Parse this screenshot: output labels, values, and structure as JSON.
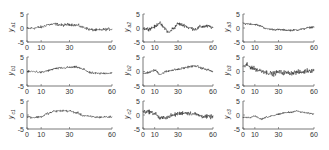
{
  "figure": {
    "layout": {
      "rows": 3,
      "cols": 3
    },
    "axes_color": "#555555",
    "line_color": "#222222"
  },
  "chart_data": [
    {
      "type": "line",
      "id": "a1",
      "ylabel": "y",
      "ylabel_sub": "a1",
      "xlim": [
        0,
        60
      ],
      "ylim": [
        -5,
        5
      ],
      "xticks": [
        0,
        10,
        30,
        60
      ],
      "yticks": [
        5,
        0,
        -5
      ],
      "trend_x": [
        0,
        5,
        10,
        15,
        20,
        25,
        30,
        35,
        40,
        45,
        50,
        55,
        60
      ],
      "trend_y": [
        -0.2,
        0.0,
        0.3,
        1.2,
        1.4,
        1.0,
        1.3,
        1.0,
        0.2,
        -0.6,
        -0.8,
        -0.5,
        -0.4
      ],
      "noise": 0.45
    },
    {
      "type": "line",
      "id": "a2",
      "ylabel": "y",
      "ylabel_sub": "a2",
      "xlim": [
        0,
        60
      ],
      "ylim": [
        -5,
        5
      ],
      "xticks": [
        0,
        10,
        30,
        60
      ],
      "yticks": [
        5,
        0,
        -5
      ],
      "trend_x": [
        0,
        5,
        10,
        14,
        18,
        22,
        26,
        30,
        35,
        40,
        45,
        50,
        55,
        60
      ],
      "trend_y": [
        -0.2,
        -0.3,
        0.4,
        1.8,
        0.2,
        -1.6,
        -0.2,
        1.5,
        1.0,
        0.0,
        -0.4,
        0.5,
        0.6,
        0.2
      ],
      "noise": 0.55
    },
    {
      "type": "line",
      "id": "a3",
      "ylabel": "y",
      "ylabel_sub": "a3",
      "xlim": [
        0,
        60
      ],
      "ylim": [
        -5,
        5
      ],
      "xticks": [
        0,
        10,
        30,
        60
      ],
      "yticks": [
        5,
        0,
        -5
      ],
      "trend_x": [
        0,
        5,
        10,
        15,
        20,
        25,
        30,
        35,
        40,
        45,
        50,
        55,
        60
      ],
      "trend_y": [
        1.6,
        1.5,
        1.3,
        0.7,
        -0.3,
        -0.5,
        -0.6,
        -0.7,
        -0.8,
        -0.7,
        -0.4,
        0.1,
        0.4
      ],
      "noise": 0.3
    },
    {
      "type": "line",
      "id": "b1",
      "ylabel": "y",
      "ylabel_sub": "b1",
      "xlim": [
        0,
        60
      ],
      "ylim": [
        -5,
        5
      ],
      "xticks": [
        0,
        10,
        30,
        60
      ],
      "yticks": [
        5,
        0,
        -5
      ],
      "trend_x": [
        0,
        5,
        10,
        15,
        20,
        25,
        30,
        35,
        40,
        45,
        50,
        55,
        60
      ],
      "trend_y": [
        -0.1,
        0.0,
        -0.3,
        0.3,
        1.0,
        1.2,
        1.4,
        1.5,
        0.7,
        -0.5,
        -0.7,
        -0.6,
        -0.5
      ],
      "noise": 0.35
    },
    {
      "type": "line",
      "id": "b2",
      "ylabel": "y",
      "ylabel_sub": "b2",
      "xlim": [
        0,
        60
      ],
      "ylim": [
        -5,
        5
      ],
      "xticks": [
        0,
        10,
        30,
        60
      ],
      "yticks": [
        5,
        0,
        -5
      ],
      "trend_x": [
        0,
        5,
        10,
        15,
        20,
        25,
        30,
        35,
        40,
        45,
        50,
        55,
        60
      ],
      "trend_y": [
        -0.8,
        -0.3,
        0.4,
        -0.9,
        0.0,
        0.5,
        0.7,
        1.2,
        1.7,
        1.9,
        1.2,
        0.6,
        0.0
      ],
      "noise": 0.35
    },
    {
      "type": "line",
      "id": "b3",
      "ylabel": "y",
      "ylabel_sub": "b3",
      "xlim": [
        0,
        60
      ],
      "ylim": [
        -5,
        5
      ],
      "xticks": [
        0,
        10,
        30,
        60
      ],
      "yticks": [
        5,
        0,
        -5
      ],
      "trend_x": [
        0,
        3,
        6,
        10,
        15,
        20,
        25,
        30,
        35,
        40,
        45,
        50,
        55,
        60
      ],
      "trend_y": [
        1.5,
        2.2,
        1.6,
        0.9,
        0.3,
        -0.3,
        -0.8,
        -0.2,
        -0.4,
        -0.5,
        -0.3,
        -0.2,
        0.3,
        0.4
      ],
      "noise": 0.7
    },
    {
      "type": "line",
      "id": "c1",
      "ylabel": "y",
      "ylabel_sub": "c1",
      "xlim": [
        0,
        60
      ],
      "ylim": [
        -5,
        5
      ],
      "xticks": [
        0,
        10,
        30,
        60
      ],
      "yticks": [
        5,
        0,
        -5
      ],
      "trend_x": [
        0,
        5,
        10,
        15,
        20,
        25,
        30,
        35,
        40,
        45,
        50,
        55,
        60
      ],
      "trend_y": [
        -0.6,
        -0.9,
        -0.6,
        0.6,
        1.4,
        1.5,
        1.4,
        0.8,
        -0.2,
        -0.6,
        -0.8,
        -0.7,
        -0.7
      ],
      "noise": 0.35
    },
    {
      "type": "line",
      "id": "c2",
      "ylabel": "y",
      "ylabel_sub": "c2",
      "xlim": [
        0,
        60
      ],
      "ylim": [
        -5,
        5
      ],
      "xticks": [
        0,
        10,
        30,
        60
      ],
      "yticks": [
        5,
        0,
        -5
      ],
      "trend_x": [
        0,
        5,
        10,
        15,
        20,
        25,
        30,
        35,
        40,
        45,
        50,
        55,
        60
      ],
      "trend_y": [
        1.2,
        1.2,
        0.6,
        -1.2,
        -0.8,
        -0.2,
        0.4,
        0.8,
        0.6,
        0.3,
        -0.4,
        -0.6,
        -0.7
      ],
      "noise": 0.65
    },
    {
      "type": "line",
      "id": "c3",
      "ylabel": "y",
      "ylabel_sub": "c3",
      "xlim": [
        0,
        60
      ],
      "ylim": [
        -5,
        5
      ],
      "xticks": [
        0,
        10,
        30,
        60
      ],
      "yticks": [
        5,
        0,
        -5
      ],
      "trend_x": [
        0,
        5,
        10,
        15,
        20,
        25,
        30,
        35,
        40,
        45,
        50,
        55,
        60
      ],
      "trend_y": [
        -0.8,
        -1.0,
        -0.4,
        -1.4,
        -0.8,
        -0.2,
        0.2,
        0.8,
        1.0,
        1.4,
        1.0,
        0.6,
        0.4
      ],
      "noise": 0.25
    }
  ]
}
